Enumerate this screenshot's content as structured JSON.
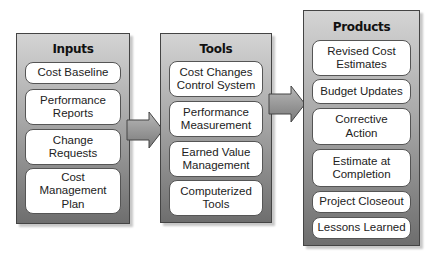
{
  "panels": {
    "inputs": {
      "title": "Inputs",
      "items": [
        "Cost Baseline",
        "Performance\nReports",
        "Change\nRequests",
        "Cost\nManagement\nPlan"
      ]
    },
    "tools": {
      "title": "Tools",
      "items": [
        "Cost Changes\nControl System",
        "Performance\nMeasurement",
        "Earned Value\nManagement",
        "Computerized\nTools"
      ]
    },
    "products": {
      "title": "Products",
      "items": [
        "Revised Cost\nEstimates",
        "Budget Updates",
        "Corrective\nAction",
        "Estimate at\nCompletion",
        "Project Closeout",
        "Lessons Learned"
      ]
    }
  },
  "colors": {
    "panel_top": "#d4d4d4",
    "panel_bottom": "#6e6e6e",
    "border": "#444444",
    "item_bg": "#ffffff"
  }
}
